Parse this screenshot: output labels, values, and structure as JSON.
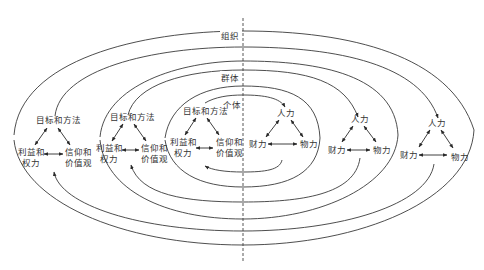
{
  "diagram": {
    "title": "",
    "levels": {
      "organization": "组织",
      "group": "群体",
      "individual": "个体"
    },
    "left_triangle": {
      "top": "目标和方法",
      "bottom_left_line1": "利益和",
      "bottom_left_line2": "权力",
      "bottom_right_line1": "信仰和",
      "bottom_right_line2": "价值观"
    },
    "right_triangle": {
      "top": "人力",
      "bottom_left": "财力",
      "bottom_right": "物力"
    },
    "colors": {
      "line": "#3a3a3a",
      "text": "#333333",
      "background": "#ffffff"
    }
  }
}
